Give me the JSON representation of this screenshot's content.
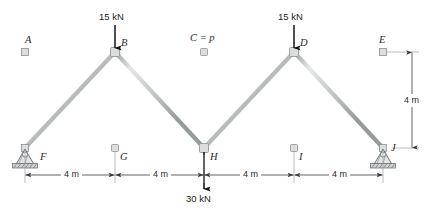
{
  "figure": {
    "type": "truss-structural-diagram",
    "span_m": 16,
    "height_m": 4,
    "panel_count": 4,
    "colors": {
      "member": "#b9bcbd",
      "member_edge": "#8d9193",
      "load_arrow": "#1c1c1c",
      "dimension": "#4a4a4a",
      "text": "#1c1c1c"
    }
  },
  "joints": {
    "top": [
      {
        "id": "A",
        "label": "A",
        "x_m": 0,
        "y_m": 4
      },
      {
        "id": "B",
        "label": "B",
        "x_m": 4,
        "y_m": 4
      },
      {
        "id": "C",
        "label": "C = p",
        "x_m": 8,
        "y_m": 4
      },
      {
        "id": "D",
        "label": "D",
        "x_m": 12,
        "y_m": 4
      },
      {
        "id": "E",
        "label": "E",
        "x_m": 16,
        "y_m": 4
      }
    ],
    "bottom": [
      {
        "id": "F",
        "label": "F",
        "x_m": 0,
        "y_m": 0
      },
      {
        "id": "G",
        "label": "G",
        "x_m": 4,
        "y_m": 0
      },
      {
        "id": "H",
        "label": "H",
        "x_m": 8,
        "y_m": 0
      },
      {
        "id": "I",
        "label": "I",
        "x_m": 12,
        "y_m": 0
      },
      {
        "id": "J",
        "label": "J",
        "x_m": 16,
        "y_m": 0
      }
    ]
  },
  "members": {
    "top_chord": [
      "A-B",
      "B-C",
      "C-D",
      "D-E"
    ],
    "bottom_chord": [
      "F-G",
      "G-H",
      "H-I",
      "I-J"
    ],
    "verticals": [
      "A-F",
      "B-G",
      "C-H",
      "D-I",
      "E-J"
    ],
    "diagonals": [
      "F-B",
      "B-H",
      "H-D",
      "D-J"
    ]
  },
  "loads": [
    {
      "id": "load-B",
      "joint": "B",
      "magnitude": "15 kN",
      "direction": "down"
    },
    {
      "id": "load-D",
      "joint": "D",
      "magnitude": "15 kN",
      "direction": "down"
    },
    {
      "id": "load-H",
      "joint": "H",
      "magnitude": "30 kN",
      "direction": "down"
    }
  ],
  "supports": [
    {
      "id": "support-F",
      "joint": "F",
      "kind": "pin"
    },
    {
      "id": "support-J",
      "joint": "J",
      "kind": "pin"
    }
  ],
  "dimensions": {
    "horizontal": [
      {
        "id": "dim-FG",
        "label": "4 m"
      },
      {
        "id": "dim-GH",
        "label": "4 m"
      },
      {
        "id": "dim-HI",
        "label": "4 m"
      },
      {
        "id": "dim-IJ",
        "label": "4 m"
      }
    ],
    "vertical": [
      {
        "id": "dim-EJ",
        "label": "4 m"
      }
    ]
  }
}
